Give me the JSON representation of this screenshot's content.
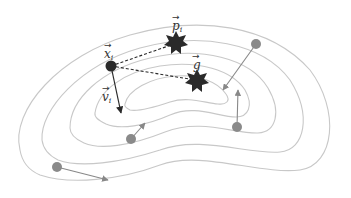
{
  "diagram": {
    "labels": {
      "x_i": "x",
      "x_i_sub": "i",
      "p_i": "p",
      "p_i_sub": "i",
      "g": "g",
      "v_i": "v",
      "v_i_sub": "i"
    },
    "colors": {
      "contour": "#c8c8c8",
      "particle_gray": "#8a8a8a",
      "arrow_gray": "#888888",
      "focus_particle": "#2a2a2a",
      "star": "#2a2a2a"
    },
    "contour_count": 5,
    "particles": [
      {
        "name": "particle-right-top",
        "x": 256,
        "y": 44,
        "vx": 222,
        "vy": 91
      },
      {
        "name": "particle-right-bottom",
        "x": 237,
        "y": 127,
        "vx": 238,
        "vy": 89
      },
      {
        "name": "particle-center-bottom",
        "x": 131,
        "y": 139,
        "vx": 145,
        "vy": 123
      },
      {
        "name": "particle-left-bottom",
        "x": 57,
        "y": 167,
        "vx": 108,
        "vy": 180
      }
    ]
  }
}
